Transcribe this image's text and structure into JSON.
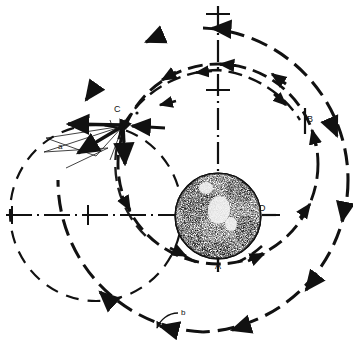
{
  "figure": {
    "type": "technical-line-diagram",
    "background_color": "#ffffff",
    "ink_color": "#111111",
    "width": 353,
    "height": 357
  },
  "labels": {
    "point_a": "A",
    "point_b": "B",
    "point_c": "C",
    "point_d": "D",
    "orbit_a": "a",
    "orbit_b": "b"
  },
  "label_positions": {
    "point_a": {
      "x": 215,
      "y": 262
    },
    "point_b": {
      "x": 305,
      "y": 116
    },
    "point_c": {
      "x": 115,
      "y": 106
    },
    "point_d": {
      "x": 259,
      "y": 205
    },
    "orbit_a": {
      "x": 58,
      "y": 143
    },
    "orbit_b": {
      "x": 181,
      "y": 317
    }
  },
  "body": {
    "name": "earth-globe",
    "center": {
      "x": 218,
      "y": 216
    },
    "radius": 43,
    "style": "stippled halftone sphere"
  },
  "axes": {
    "vertical": {
      "x": 218,
      "y_top": 8,
      "y_bottom": 270,
      "style": "dash-dot"
    },
    "horizontal": {
      "y": 215,
      "x_left": 8,
      "x_right": 278,
      "style": "dash-dot"
    }
  },
  "orbits": [
    {
      "name": "inner-orbit",
      "label": "",
      "center": {
        "x": 218,
        "y": 164
      },
      "rx": 100,
      "ry": 100,
      "style": "dashed-with-arrowheads",
      "direction": "counterclockwise"
    },
    {
      "name": "outer-orbit",
      "label": "b",
      "center": {
        "x": 203,
        "y": 180
      },
      "rx": 145,
      "ry": 152,
      "style": "heavy-dashed-with-arrowheads",
      "direction": "counterclockwise"
    },
    {
      "name": "left-orbit",
      "label": "a",
      "center": {
        "x": 96,
        "y": 213
      },
      "rx": 86,
      "ry": 88,
      "style": "light-dashed",
      "direction": "counterclockwise"
    }
  ],
  "vectors": {
    "origin": {
      "x": 123,
      "y": 126
    },
    "items": [
      {
        "name": "velocity-vector-left",
        "dx": -48,
        "dy": -2,
        "weight": "heavy"
      },
      {
        "name": "velocity-vector-down",
        "dx": 2,
        "dy": 42,
        "weight": "heavy"
      },
      {
        "name": "delta-v-vector-diagonal",
        "dx": -44,
        "dy": 27,
        "weight": "heavy"
      },
      {
        "name": "construction-line-upper",
        "dx": -44,
        "dy": 9,
        "weight": "thin"
      },
      {
        "name": "construction-line-lower",
        "dx": -46,
        "dy": 19,
        "weight": "thin"
      }
    ]
  }
}
